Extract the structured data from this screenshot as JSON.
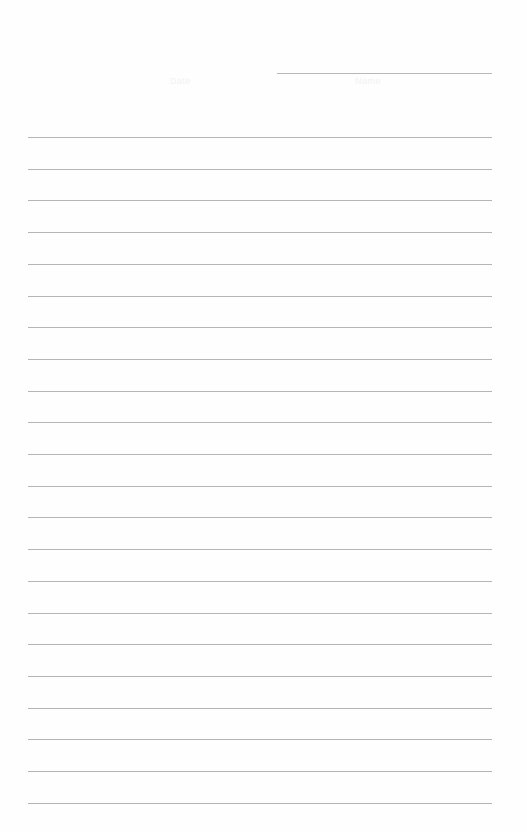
{
  "document": {
    "type": "lined-paper",
    "header": {
      "left_label": "Date",
      "right_label": "Name"
    },
    "ruled_lines": {
      "count": 22,
      "first_y": 137,
      "spacing": 31.7,
      "left_x": 28,
      "right_x": 492
    },
    "header_line": {
      "left_x": 277,
      "right_x": 492,
      "y": 73
    },
    "colors": {
      "paper": "#fefefe",
      "rule": "#b5b5b5",
      "faint_text": "#f2f2f2"
    }
  }
}
